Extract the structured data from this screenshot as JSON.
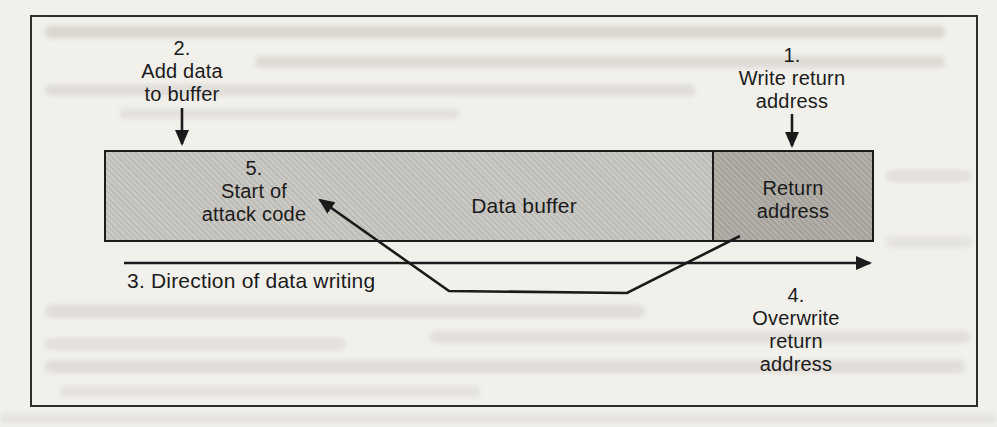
{
  "colors": {
    "page_bg": "#f2f0eb",
    "frame_border": "#2e2e2e",
    "line": "#1b1b1b",
    "text": "#1b1b1b",
    "buffer_fill": "#cbc9c4",
    "buffer_fill_dot": "#bfbdb8",
    "return_fill": "#b3b0a9",
    "return_fill_dot": "#a5a29b"
  },
  "labels": {
    "step1": "1.\nWrite return\naddress",
    "step2": "2.\nAdd data\nto buffer",
    "step3": "3. Direction of data writing",
    "step4": "4.\nOverwrite\nreturn\naddress",
    "step5": "5.\nStart of\nattack code",
    "data_buffer": "Data buffer",
    "return_address": "Return\naddress"
  }
}
